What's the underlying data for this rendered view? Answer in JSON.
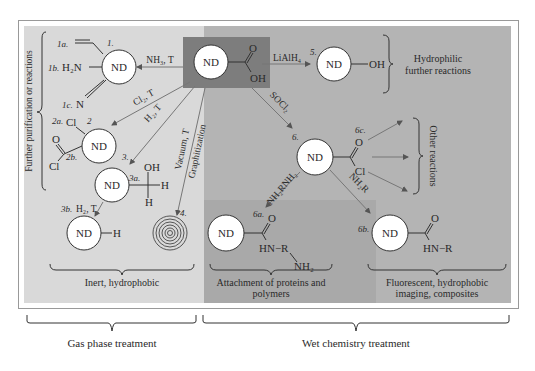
{
  "diagram": {
    "colors": {
      "gas_panel": "#d9d9d9",
      "wet_panel_mid": "#a9a9a9",
      "wet_panel_right": "#b4b4b4",
      "highlight_box": "#7d7d7d",
      "line": "#555555",
      "node_fill": "#ffffff",
      "text": "#2a2a2a"
    },
    "center": {
      "node": "ND",
      "group_top": "O",
      "group_bottom": "OH"
    },
    "node_label": "ND",
    "gas_phase": {
      "side_brace_label": "Further purification or reactions",
      "r1": {
        "num": "1.",
        "reagent": "NH₃, T",
        "a": "1a.",
        "b": "1b.",
        "b_group": "H₂N",
        "c": "1c.",
        "c_group": "N"
      },
      "r2": {
        "num": "2",
        "reagent": "Cl₂, T",
        "a": "2a.",
        "a_group": "Cl",
        "b": "2b.",
        "b_o": "O",
        "b_cl": "Cl"
      },
      "r3": {
        "num": "3.",
        "reagent": "H₂, T",
        "a": "3a.",
        "a_oh": "OH",
        "a_h1": "H",
        "a_h2": "H",
        "b": "3b.",
        "b_reagent": "H₂, T",
        "b_group": "H"
      },
      "r4": {
        "num": "4.",
        "reagent_1": "Vacuum, T",
        "reagent_2": "Graphitization"
      },
      "bottom_label": "Inert, hydrophobic"
    },
    "wet_chemistry": {
      "r5": {
        "num": "5.",
        "reagent": "LiAlH₄",
        "group": "OH",
        "label_1": "Hydrophilic",
        "label_2": "further reactions"
      },
      "r6": {
        "num": "6.",
        "reagent": "SOCl₂",
        "o": "O",
        "cl": "Cl"
      },
      "r6a": {
        "num": "6a.",
        "reagent": "NH₂RNH₂",
        "o": "O",
        "hn_r": "HN−R",
        "nh2": "NH₂",
        "label_1": "Attachment of proteins and",
        "label_2": "polymers"
      },
      "r6b": {
        "num": "6b.",
        "reagent": "NH₂R",
        "o": "O",
        "hn_r": "HN−R",
        "label_1": "Fluorescent, hydrophobic",
        "label_2": "imaging, composites"
      },
      "r6c": {
        "num": "6c.",
        "label": "Other reactions"
      }
    },
    "bottom_braces": {
      "gas": "Gas phase treatment",
      "wet": "Wet chemistry treatment"
    }
  }
}
